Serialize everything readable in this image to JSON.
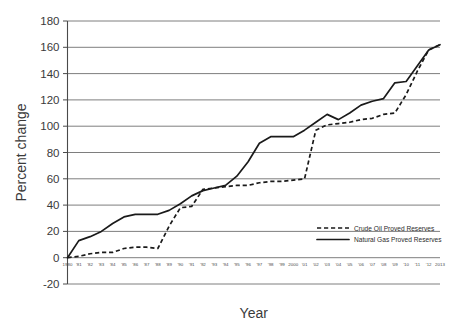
{
  "chart_data": {
    "type": "line",
    "title": "",
    "xlabel": "Year",
    "ylabel": "Percent change",
    "ylim": [
      -20,
      180
    ],
    "ytick_step": 20,
    "yticks": [
      -20,
      0,
      20,
      40,
      60,
      80,
      100,
      120,
      140,
      160,
      180
    ],
    "grid": true,
    "legend_position": "bottom-right",
    "x": [
      1980,
      1981,
      1982,
      1983,
      1984,
      1985,
      1986,
      1987,
      1988,
      1989,
      1990,
      1991,
      1992,
      1993,
      1994,
      1995,
      1996,
      1997,
      1998,
      1999,
      2000,
      2001,
      2002,
      2003,
      2004,
      2005,
      2006,
      2007,
      2008,
      2009,
      2010,
      2011,
      2012,
      2013
    ],
    "xtick_labels": [
      "1980",
      "'81",
      "'82",
      "'83",
      "'84",
      "'85",
      "'86",
      "'87",
      "'88",
      "'89",
      "'90",
      "'91",
      "'92",
      "'93",
      "'94",
      "'95",
      "'96",
      "'97",
      "'98",
      "'99",
      "2000",
      "'01",
      "'02",
      "'03",
      "'04",
      "'05",
      "'06",
      "'07",
      "'08",
      "'09",
      "'10",
      "'11",
      "'12",
      "2013"
    ],
    "series": [
      {
        "name": "Crude Oil Proved Reserves",
        "style": "dashed",
        "color": "#1a1a1a",
        "values": [
          0,
          1,
          3,
          4,
          4,
          7,
          8,
          8,
          7,
          24,
          38,
          39,
          52,
          53,
          54,
          55,
          55,
          57,
          58,
          58,
          59,
          60,
          97,
          101,
          102,
          103,
          105,
          106,
          109,
          110,
          124,
          142,
          158,
          162
        ]
      },
      {
        "name": "Natural Gas Proved Reserves",
        "style": "solid",
        "color": "#1a1a1a",
        "values": [
          0,
          13,
          16,
          20,
          26,
          31,
          33,
          33,
          33,
          36,
          41,
          47,
          51,
          53,
          55,
          62,
          73,
          87,
          92,
          92,
          92,
          97,
          103,
          109,
          105,
          110,
          116,
          119,
          121,
          133,
          134,
          146,
          158,
          162
        ]
      }
    ],
    "legend": [
      {
        "label": "Crude Oil Proved Reserves",
        "style": "dashed"
      },
      {
        "label": "Natural Gas Proved Reserves",
        "style": "solid"
      }
    ]
  }
}
